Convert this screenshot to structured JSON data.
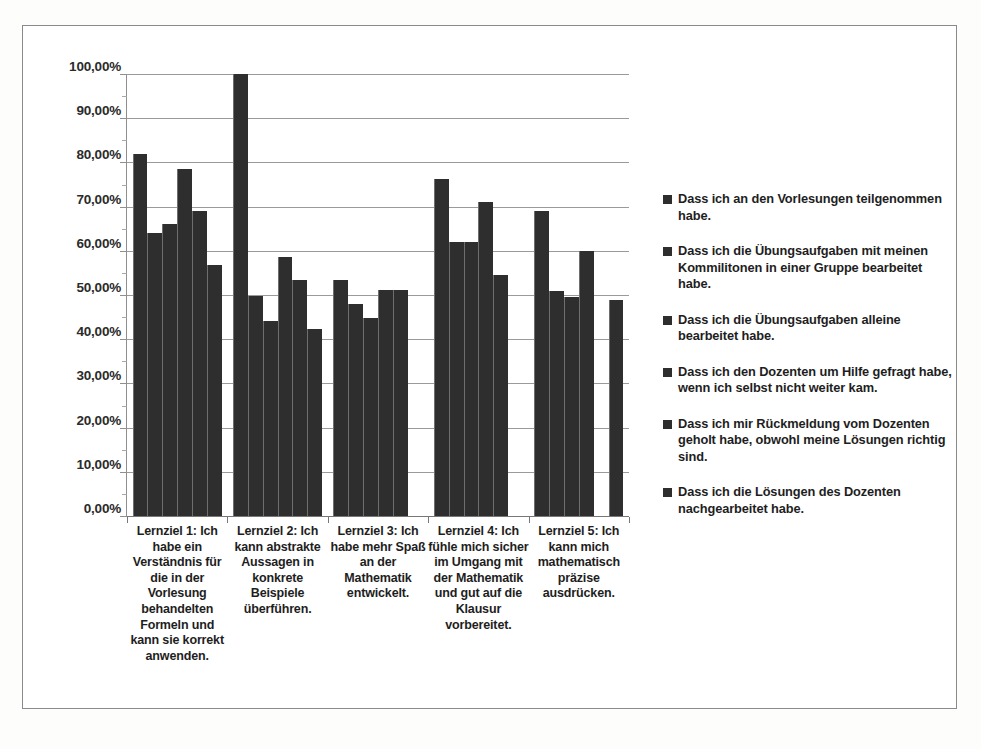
{
  "chart_data": {
    "type": "bar",
    "title": "",
    "subtitle": "",
    "xlabel": "",
    "ylabel": "",
    "ylim": [
      0,
      100
    ],
    "ytick_labels": [
      "0,00%",
      "10,00%",
      "20,00%",
      "30,00%",
      "40,00%",
      "50,00%",
      "60,00%",
      "70,00%",
      "80,00%",
      "90,00%",
      "100,00%"
    ],
    "ytick_values": [
      0,
      10,
      20,
      30,
      40,
      50,
      60,
      70,
      80,
      90,
      100
    ],
    "grid": true,
    "legend_position": "right",
    "categories": [
      "Lernziel 1: Ich habe ein Verständnis für die in der Vorlesung behandelten Formeln und kann sie korrekt anwenden.",
      "Lernziel 2: Ich kann abstrakte Aussagen in konkrete Beispiele überführen.",
      "Lernziel 3: Ich habe mehr Spaß an der Mathematik entwickelt.",
      "Lernziel 4: Ich fühle mich sicher im Umgang mit der Mathematik und gut auf die Klausur vorbereitet.",
      "Lernziel 5: Ich kann mich mathematisch präzise ausdrücken."
    ],
    "series": [
      {
        "name": "Dass ich an den Vorlesungen teilgenommen habe.",
        "values": [
          82.0,
          100.0,
          53.3,
          76.2,
          69.0
        ]
      },
      {
        "name": "Dass ich die Übungsaufgaben mit meinen Kommilitonen in einer Gruppe bearbeitet habe.",
        "values": [
          64.0,
          49.7,
          48.0,
          62.0,
          51.0
        ]
      },
      {
        "name": "Dass ich die Übungsaufgaben alleine bearbeitet habe.",
        "values": [
          66.0,
          44.2,
          44.8,
          62.0,
          49.6
        ]
      },
      {
        "name": "Dass ich den Dozenten um Hilfe gefragt habe, wenn ich selbst nicht weiter kam.",
        "values": [
          78.4,
          58.7,
          51.2,
          71.0,
          60.0
        ]
      },
      {
        "name": "Dass ich mir Rückmeldung vom Dozenten geholt habe, obwohl meine Lösungen richtig sind.",
        "values": [
          69.0,
          53.3,
          51.2,
          54.5,
          null
        ]
      },
      {
        "name": "Dass ich die Lösungen des Dozenten nachgearbeitet habe.",
        "values": [
          56.8,
          42.2,
          null,
          null,
          48.9
        ]
      }
    ],
    "bar_color": "#2e2e2e"
  },
  "axis": {
    "tick_0": "0,00%",
    "tick_10": "10,00%",
    "tick_20": "20,00%",
    "tick_30": "30,00%",
    "tick_40": "40,00%",
    "tick_50": "50,00%",
    "tick_60": "60,00%",
    "tick_70": "70,00%",
    "tick_80": "80,00%",
    "tick_90": "90,00%",
    "tick_100": "100,00%"
  },
  "categories_display": {
    "cat_1": "Lernziel 1: Ich habe ein Verständnis für die in der Vorlesung behandelten Formeln und kann sie korrekt anwenden.",
    "cat_2": "Lernziel 2: Ich kann abstrakte Aussagen in konkrete Beispiele überführen.",
    "cat_3": "Lernziel 3: Ich habe mehr Spaß an der Mathematik entwickelt.",
    "cat_4": "Lernziel 4: Ich fühle mich sicher im Umgang mit der Mathematik und gut auf die Klausur vorbereitet.",
    "cat_5": "Lernziel 5: Ich kann mich mathematisch präzise ausdrücken."
  },
  "legend": {
    "items": [
      {
        "label": "Dass ich an den Vorlesungen teilgenommen habe."
      },
      {
        "label": "Dass ich die Übungsaufgaben mit meinen Kommilitonen in einer Gruppe bearbeitet habe."
      },
      {
        "label": "Dass ich die Übungsaufgaben alleine bearbeitet habe."
      },
      {
        "label": "Dass ich den Dozenten um Hilfe gefragt habe, wenn ich selbst nicht weiter kam."
      },
      {
        "label": "Dass ich mir Rückmeldung vom Dozenten geholt habe, obwohl meine Lösungen richtig sind."
      },
      {
        "label": "Dass ich die Lösungen des Dozenten nachgearbeitet habe."
      }
    ]
  }
}
